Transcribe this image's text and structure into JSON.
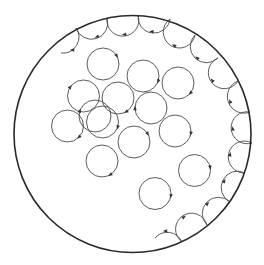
{
  "diagram": {
    "title": "",
    "colors": {
      "background": "#ffffff",
      "boundary": "#2a2a2a",
      "orbit": "#4a4a4a",
      "arrow": "#333333"
    },
    "boundary": {
      "cx": 132.5,
      "cy": 134,
      "r": 118.5
    },
    "orbit_radius": 16,
    "bulk_orbits": [
      {
        "cx": 103,
        "cy": 64,
        "arrow_angle": -30
      },
      {
        "cx": 143,
        "cy": 76,
        "arrow_angle": 20
      },
      {
        "cx": 178,
        "cy": 83,
        "arrow_angle": 40
      },
      {
        "cx": 83.5,
        "cy": 96,
        "arrow_angle": 215
      },
      {
        "cx": 118,
        "cy": 98,
        "arrow_angle": 60
      },
      {
        "cx": 151,
        "cy": 108,
        "arrow_angle": 180
      },
      {
        "cx": 95,
        "cy": 116,
        "arrow_angle": 200
      },
      {
        "cx": 102.5,
        "cy": 122,
        "arrow_angle": 20
      },
      {
        "cx": 67.5,
        "cy": 126,
        "arrow_angle": 45
      },
      {
        "cx": 175,
        "cy": 131,
        "arrow_angle": 10
      },
      {
        "cx": 134,
        "cy": 142,
        "arrow_angle": -30
      },
      {
        "cx": 102,
        "cy": 161,
        "arrow_angle": 60
      },
      {
        "cx": 194.5,
        "cy": 170.5,
        "arrow_angle": -10
      },
      {
        "cx": 155,
        "cy": 193.5,
        "arrow_angle": 10
      }
    ],
    "edge_cusps": [
      [
        107,
        18
      ],
      [
        138,
        15
      ],
      [
        170,
        19
      ],
      [
        195,
        35
      ],
      [
        218,
        58
      ],
      [
        238,
        81
      ],
      [
        250,
        112
      ],
      [
        252,
        143
      ],
      [
        245,
        173
      ],
      [
        230,
        202
      ],
      [
        207,
        225
      ],
      [
        182,
        242
      ]
    ],
    "edge_start": {
      "x": 61,
      "y": 53,
      "first_cusp": [
        76,
        28
      ]
    },
    "edge_end": {
      "x": 155,
      "y": 238
    }
  }
}
